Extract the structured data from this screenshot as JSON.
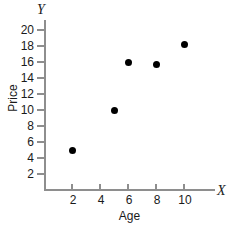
{
  "chart_data": {
    "type": "scatter",
    "title": "",
    "xlabel": "Age",
    "ylabel": "Price",
    "x_axis_letter": "X",
    "y_axis_letter": "Y",
    "xlim": [
      0,
      12
    ],
    "ylim": [
      0,
      21
    ],
    "xticks": [
      2,
      4,
      6,
      8,
      10
    ],
    "yticks": [
      2,
      4,
      6,
      8,
      10,
      12,
      14,
      16,
      18,
      20
    ],
    "xtick_labels": [
      "2",
      "4",
      "6",
      "8",
      "10"
    ],
    "ytick_labels": [
      "2",
      "4",
      "6",
      "8",
      "10",
      "12",
      "14",
      "16",
      "18",
      "20"
    ],
    "grid": false,
    "legend": null,
    "marker_color": "#000000",
    "axis_color": "#8e8e8e",
    "background_color": "#ffffff",
    "points": [
      {
        "x": 2,
        "y": 5
      },
      {
        "x": 5,
        "y": 10
      },
      {
        "x": 6,
        "y": 16
      },
      {
        "x": 8,
        "y": 15.7
      },
      {
        "x": 10,
        "y": 18.2
      }
    ]
  }
}
